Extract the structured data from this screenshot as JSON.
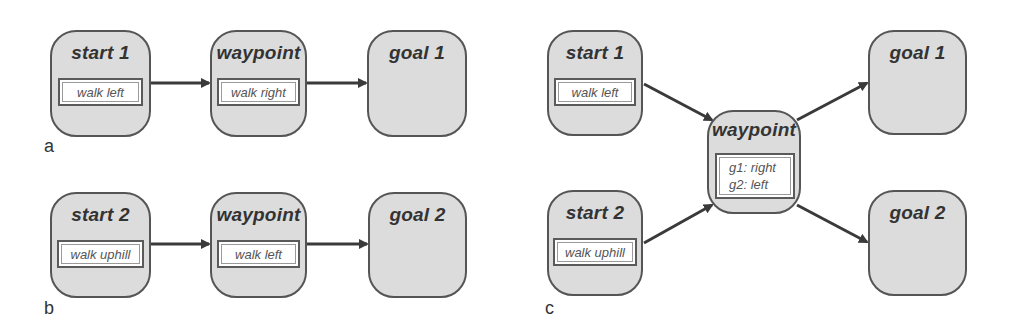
{
  "panels": {
    "a": {
      "label": "a",
      "start": {
        "title": "start 1",
        "action": "walk left"
      },
      "waypoint": {
        "title": "waypoint",
        "action": "walk right"
      },
      "goal": {
        "title": "goal 1"
      }
    },
    "b": {
      "label": "b",
      "start": {
        "title": "start 2",
        "action": "walk uphill"
      },
      "waypoint": {
        "title": "waypoint",
        "action": "walk left"
      },
      "goal": {
        "title": "goal 2"
      }
    },
    "c": {
      "label": "c",
      "start1": {
        "title": "start 1",
        "action": "walk left"
      },
      "start2": {
        "title": "start 2",
        "action": "walk uphill"
      },
      "waypoint": {
        "title": "waypoint",
        "action_line1": "g1: right",
        "action_line2": "g2: left"
      },
      "goal1": {
        "title": "goal 1"
      },
      "goal2": {
        "title": "goal 2"
      }
    }
  },
  "edges": [
    {
      "panel": "a",
      "from": "start 1",
      "to": "waypoint"
    },
    {
      "panel": "a",
      "from": "waypoint",
      "to": "goal 1"
    },
    {
      "panel": "b",
      "from": "start 2",
      "to": "waypoint"
    },
    {
      "panel": "b",
      "from": "waypoint",
      "to": "goal 2"
    },
    {
      "panel": "c",
      "from": "start 1",
      "to": "waypoint"
    },
    {
      "panel": "c",
      "from": "start 2",
      "to": "waypoint"
    },
    {
      "panel": "c",
      "from": "waypoint",
      "to": "goal 1"
    },
    {
      "panel": "c",
      "from": "waypoint",
      "to": "goal 2"
    }
  ],
  "colors": {
    "node_fill": "#dcdcdc",
    "node_border": "#555555",
    "arrow": "#3a3a3a",
    "text": "#333333"
  }
}
